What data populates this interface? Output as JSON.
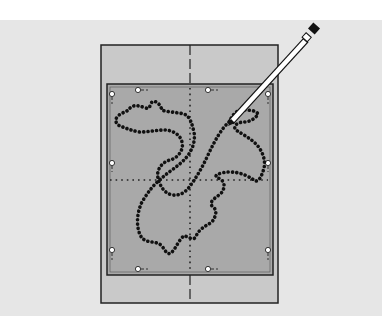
{
  "caption": {
    "text": ""
  },
  "illustration": {
    "subject": "embroidery hoop template with traced rooster outline",
    "colors": {
      "background": "#e6e6e6",
      "frame": "#c9c9c9",
      "inner_area": "#a9a9a9",
      "outline_dots": "#111111",
      "pencil_body": "#ffffff",
      "pencil_tip": "#111111"
    },
    "icons": [
      "pencil-icon",
      "pin-marker-icon"
    ]
  }
}
